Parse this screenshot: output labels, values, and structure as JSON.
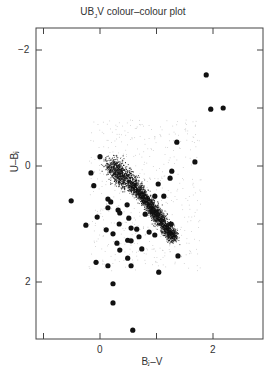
{
  "chart_data": {
    "type": "scatter",
    "xlabel": "BJ-V",
    "ylabel": "U-BJ",
    "xlim": [
      -1.15,
      2.85
    ],
    "ylim": [
      2.97,
      -2.38
    ],
    "y_inverted": true,
    "grid": false,
    "legend": null,
    "x_ticks": [
      {
        "value": 0,
        "label": "0"
      },
      {
        "value": 2,
        "label": "2"
      }
    ],
    "x_minor_ticks": [
      -1,
      1,
      3
    ],
    "y_ticks": [
      {
        "value": -2,
        "label": "-2"
      },
      {
        "value": 0,
        "label": "0"
      },
      {
        "value": 2,
        "label": "2"
      }
    ],
    "y_minor_ticks": [
      -1,
      1
    ],
    "series": [
      {
        "name": "stars (dense locus)",
        "style": "small dots",
        "description": "dense cloud of tiny points forming the stellar main-sequence locus from about (0.3,0.1) curving to (1.3,1.3)",
        "locus": [
          [
            0.2,
            -0.05
          ],
          [
            0.35,
            0.15
          ],
          [
            0.55,
            0.3
          ],
          [
            0.75,
            0.5
          ],
          [
            0.9,
            0.7
          ],
          [
            1.05,
            0.9
          ],
          [
            1.2,
            1.1
          ],
          [
            1.3,
            1.25
          ]
        ]
      },
      {
        "name": "quasars / outliers",
        "style": "large filled circles",
        "x": [
          1.88,
          1.96,
          2.18,
          1.36,
          1.68,
          1.27,
          1.24,
          1.03,
          0.97,
          1.13,
          0.92,
          0.8,
          1.26,
          0.97,
          1.38,
          1.04,
          0.0,
          -0.16,
          -0.51,
          -0.11,
          0.14,
          0.19,
          0.14,
          0.32,
          0.35,
          0.48,
          0.51,
          0.65,
          -0.25,
          -0.05,
          0.11,
          0.3,
          0.49,
          0.35,
          0.49,
          -0.07,
          0.14,
          0.23,
          0.34,
          0.55,
          0.74,
          0.55,
          0.69,
          0.87,
          0.55,
          0.23,
          0.23,
          0.58
        ],
        "y": [
          -1.57,
          -0.98,
          -1.0,
          -0.41,
          -0.07,
          0.09,
          0.21,
          0.31,
          0.52,
          0.52,
          0.79,
          0.83,
          1.0,
          1.19,
          1.55,
          1.83,
          -0.16,
          0.12,
          0.6,
          0.34,
          0.57,
          0.62,
          0.72,
          0.76,
          0.81,
          0.67,
          0.9,
          1.09,
          1.02,
          0.88,
          1.1,
          1.33,
          1.28,
          1.45,
          1.59,
          1.66,
          1.72,
          1.17,
          1.0,
          1.29,
          1.43,
          1.07,
          1.22,
          1.14,
          1.72,
          2.03,
          2.36,
          2.83
        ]
      }
    ]
  },
  "labels": {
    "title_main": "UB",
    "title_sub": "J",
    "title_rest": "V colour–colour plot",
    "xlabel": "Bⱼ–V",
    "ylabel": "U–Bⱼ",
    "x0": "0",
    "x2": "2",
    "ym2": "−2",
    "y0": "0",
    "y2": "2"
  }
}
